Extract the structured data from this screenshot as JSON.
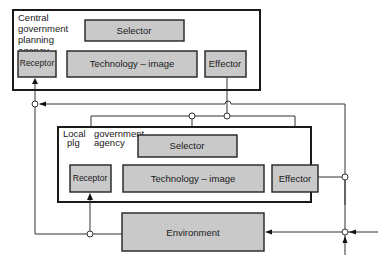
{
  "diagram": {
    "central_agency": {
      "title_lines": [
        "Central",
        "government",
        "planning",
        "agency"
      ],
      "selector": "Selector",
      "receptor": "Receptor",
      "technology_image": "Technology – image",
      "effector": "Effector"
    },
    "local_agency": {
      "title_left_lines": [
        "Local",
        "plg"
      ],
      "title_right_lines": [
        "government",
        "agency"
      ],
      "selector": "Selector",
      "receptor": "Receptor",
      "technology_image": "Technology – image",
      "effector": "Effector"
    },
    "environment": "Environment",
    "colors": {
      "box_fill": "#c9c9c9",
      "outline": "#1a1a1a",
      "background": "#ffffff"
    }
  }
}
